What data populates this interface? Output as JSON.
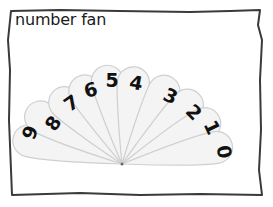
{
  "title": "number fan",
  "fan": {
    "pivot": {
      "x": 122,
      "y": 164
    },
    "petals": [
      {
        "label": "9",
        "angle": 166,
        "length": 112,
        "num_x": 31,
        "num_y": 133,
        "rot": -70
      },
      {
        "label": "8",
        "angle": 150,
        "length": 110,
        "num_x": 54,
        "num_y": 124,
        "rot": -55
      },
      {
        "label": "7",
        "angle": 133,
        "length": 100,
        "num_x": 72,
        "num_y": 104,
        "rot": -35
      },
      {
        "label": "6",
        "angle": 117,
        "length": 98,
        "num_x": 91,
        "num_y": 91,
        "rot": -15
      },
      {
        "label": "5",
        "angle": 100,
        "length": 100,
        "num_x": 112,
        "num_y": 81,
        "rot": 0
      },
      {
        "label": "4",
        "angle": 82,
        "length": 98,
        "num_x": 136,
        "num_y": 84,
        "rot": 10
      },
      {
        "label": "3",
        "angle": 60,
        "length": 100,
        "num_x": 170,
        "num_y": 97,
        "rot": 25
      },
      {
        "label": "2",
        "angle": 42,
        "length": 104,
        "num_x": 193,
        "num_y": 113,
        "rot": 45
      },
      {
        "label": "1",
        "angle": 26,
        "length": 108,
        "num_x": 211,
        "num_y": 128,
        "rot": 65
      },
      {
        "label": "0",
        "angle": 10,
        "length": 112,
        "num_x": 223,
        "num_y": 152,
        "rot": 80
      }
    ]
  },
  "colors": {
    "frame": "#3a3a3a",
    "petal_fill": "#f4f4f4",
    "petal_stroke": "#cfcfcf",
    "number": "#111111",
    "text": "#1a1a1a"
  }
}
